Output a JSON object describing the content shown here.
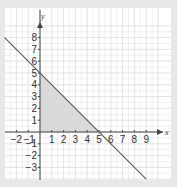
{
  "graph": {
    "x_axis_label": "x",
    "y_axis_label": "y",
    "x_range": [
      -3,
      10
    ],
    "y_range": [
      -4,
      9
    ],
    "x_ticks": [
      -2,
      -1,
      1,
      2,
      3,
      4,
      5,
      6,
      7,
      8,
      9
    ],
    "y_ticks": [
      8,
      7,
      6,
      5,
      4,
      3,
      2,
      1,
      -1,
      -2,
      -3
    ],
    "line": {
      "equation": "y = 5 - x",
      "from": [
        -3,
        8
      ],
      "to": [
        9,
        -4
      ],
      "color": "#555555"
    },
    "shaded_region": {
      "vertices": [
        [
          0,
          0
        ],
        [
          0,
          5
        ],
        [
          5,
          0
        ]
      ],
      "color": "#d9d9d9"
    },
    "grid_color": "#dcdcdc",
    "axis_color": "#444444"
  }
}
